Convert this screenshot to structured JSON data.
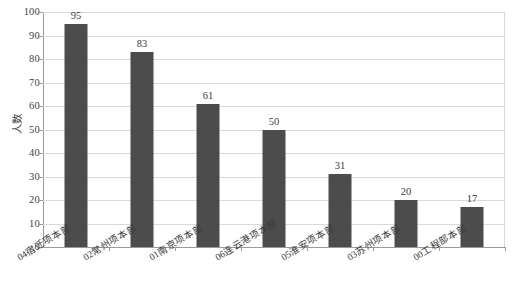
{
  "chart_data": {
    "type": "bar",
    "title": "",
    "xlabel": "",
    "ylabel": "人数",
    "ylim": [
      0,
      100
    ],
    "ytick_step": 10,
    "yticks": [
      100,
      90,
      80,
      70,
      60,
      50,
      40,
      30,
      20,
      10,
      0
    ],
    "grid": true,
    "legend": "none",
    "bar_color": "#4c4c4c",
    "categories": [
      "04宿迁项本部",
      "02常州项本部",
      "01南京项本部",
      "06连云港项本部",
      "05淮安项本部",
      "03苏州项本部",
      "00工程部本部"
    ],
    "values": [
      95,
      83,
      61,
      50,
      31,
      20,
      17
    ],
    "data_labels": [
      "95",
      "83",
      "61",
      "50",
      "31",
      "20",
      "17"
    ]
  },
  "axis": {
    "y_title": "人数",
    "y_ticks": [
      "100",
      "90",
      "80",
      "70",
      "60",
      "50",
      "40",
      "30",
      "20",
      "10",
      "0"
    ]
  }
}
